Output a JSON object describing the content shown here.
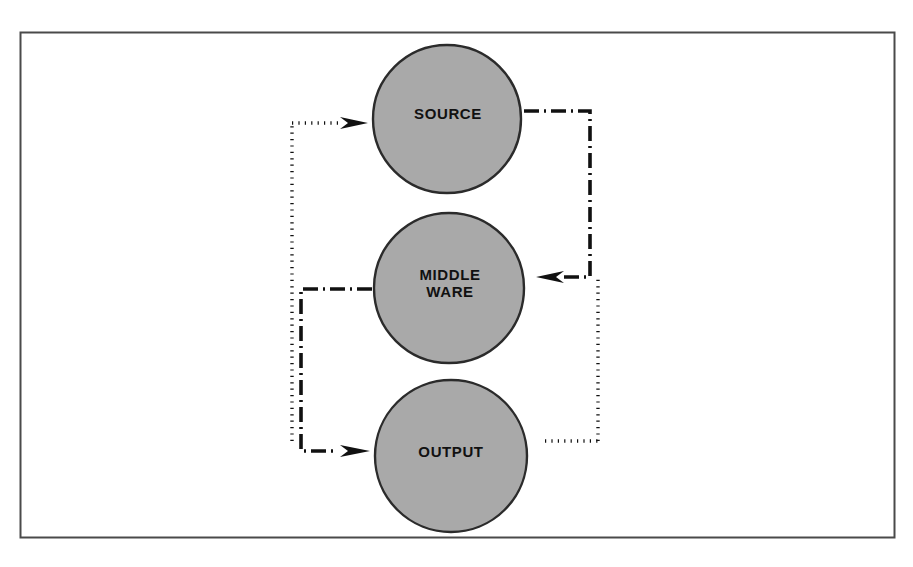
{
  "diagram": {
    "title": "",
    "frame": {
      "name": "outer-border",
      "stroke": "#4a4a4a",
      "x": 20,
      "y": 32,
      "width": 875,
      "height": 506
    },
    "nodes": [
      {
        "id": "source",
        "label": "SOURCE",
        "shape": "circle",
        "cx": 447,
        "cy": 119,
        "r": 74,
        "fill": "#a9a9a9",
        "stroke": "#2b2b2b"
      },
      {
        "id": "middleware",
        "label": "MIDDLE\nWARE",
        "shape": "circle",
        "cx": 449,
        "cy": 288,
        "r": 75,
        "fill": "#a9a9a9",
        "stroke": "#2b2b2b"
      },
      {
        "id": "output",
        "label": "OUTPUT",
        "shape": "circle",
        "cx": 451,
        "cy": 456,
        "r": 76,
        "fill": "#a9a9a9",
        "stroke": "#2b2b2b"
      }
    ],
    "edges": [
      {
        "id": "source-to-middleware",
        "style": "dash-dot",
        "from": "source",
        "to": "middleware",
        "arrow": true,
        "color": "#111111"
      },
      {
        "id": "middleware-to-output",
        "style": "dash-dot",
        "from": "middleware",
        "to": "output",
        "arrow": true,
        "color": "#111111"
      },
      {
        "id": "output-to-source",
        "style": "dotted",
        "from": "output",
        "to": "source",
        "arrow": true,
        "color": "#111111"
      }
    ]
  }
}
